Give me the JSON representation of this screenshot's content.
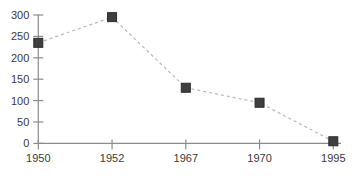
{
  "chart_data": {
    "type": "line",
    "title": "",
    "xlabel": "",
    "ylabel": "",
    "categories": [
      "1950",
      "1952",
      "1967",
      "1970",
      "1995"
    ],
    "values": [
      235,
      295,
      130,
      95,
      5
    ],
    "yticks": [
      0,
      50,
      100,
      150,
      200,
      250,
      300
    ],
    "ylim": [
      0,
      300
    ],
    "grid": false,
    "legend": "none",
    "line_style": "dashed",
    "marker_shape": "square",
    "colors": {
      "background": "#ffffff",
      "axis": "#8c8c8c",
      "tick": "#8c8c8c",
      "label": "#3a3a3a",
      "line": "#b8b8b8",
      "marker_fill": "#3f3f3f",
      "marker_border": "#2b2b2b"
    }
  }
}
